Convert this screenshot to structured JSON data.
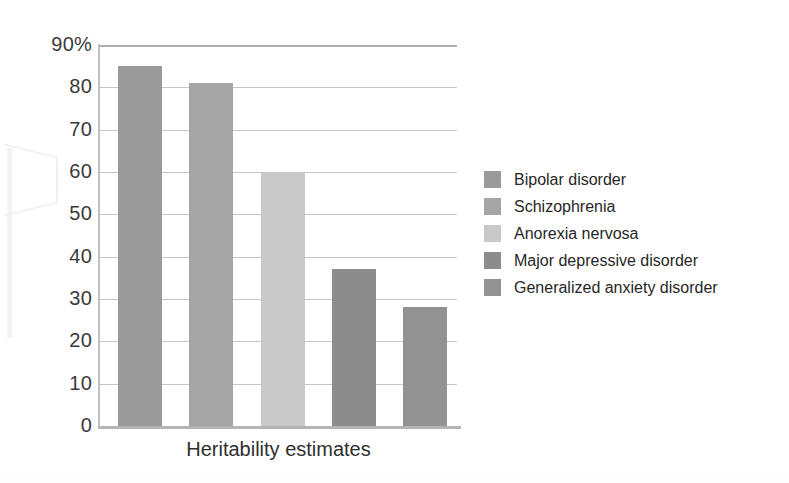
{
  "chart_data": {
    "type": "bar",
    "title": "",
    "xlabel": "Heritability estimates",
    "ylabel": "",
    "categories": [
      "Bipolar disorder",
      "Schizophrenia",
      "Anorexia nervosa",
      "Major depressive disorder",
      "Generalized anxiety disorder"
    ],
    "values": [
      85,
      81,
      60,
      37,
      28
    ],
    "ylim": [
      0,
      90
    ],
    "ytick_labels": [
      "0",
      "10",
      "20",
      "30",
      "40",
      "50",
      "60",
      "70",
      "80",
      "90%"
    ],
    "ytick_values": [
      0,
      10,
      20,
      30,
      40,
      50,
      60,
      70,
      80,
      90
    ],
    "grid": true,
    "legend_position": "right",
    "bar_colors": [
      "#9a9a9a",
      "#a5a5a5",
      "#c9c9c9",
      "#8c8c8c",
      "#929292"
    ],
    "units": "percent"
  },
  "legend": {
    "entries": [
      {
        "label": "Bipolar disorder",
        "color": "#9a9a9a"
      },
      {
        "label": "Schizophrenia",
        "color": "#a5a5a5"
      },
      {
        "label": "Anorexia nervosa",
        "color": "#c9c9c9"
      },
      {
        "label": "Major depressive disorder",
        "color": "#8c8c8c"
      },
      {
        "label": "Generalized anxiety disorder",
        "color": "#929292"
      }
    ]
  },
  "colors": {
    "gridline": "#c6c6c6",
    "axis": "#b4b4b4",
    "text": "#2b2b2b",
    "background": "#ffffff"
  }
}
